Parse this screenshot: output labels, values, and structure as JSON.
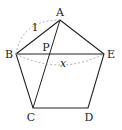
{
  "figure": {
    "type": "regular pentagon with diagonals",
    "vertices": [
      {
        "label": "A",
        "x": 60,
        "y": 20,
        "lx": 60,
        "ly": 16
      },
      {
        "label": "B",
        "x": 16,
        "y": 54,
        "lx": 9,
        "ly": 58
      },
      {
        "label": "C",
        "x": 33,
        "y": 108,
        "lx": 31,
        "ly": 121
      },
      {
        "label": "D",
        "x": 88,
        "y": 108,
        "lx": 89,
        "ly": 121
      },
      {
        "label": "E",
        "x": 104,
        "y": 54,
        "lx": 111,
        "ly": 58
      }
    ],
    "intersection": {
      "label": "P",
      "x": 48,
      "y": 54,
      "lx": 46,
      "ly": 51
    },
    "side_label": "1",
    "diagonal_label": "x",
    "colors": {
      "line": "#222222",
      "dashed": "#999999",
      "text": "#222222"
    }
  }
}
